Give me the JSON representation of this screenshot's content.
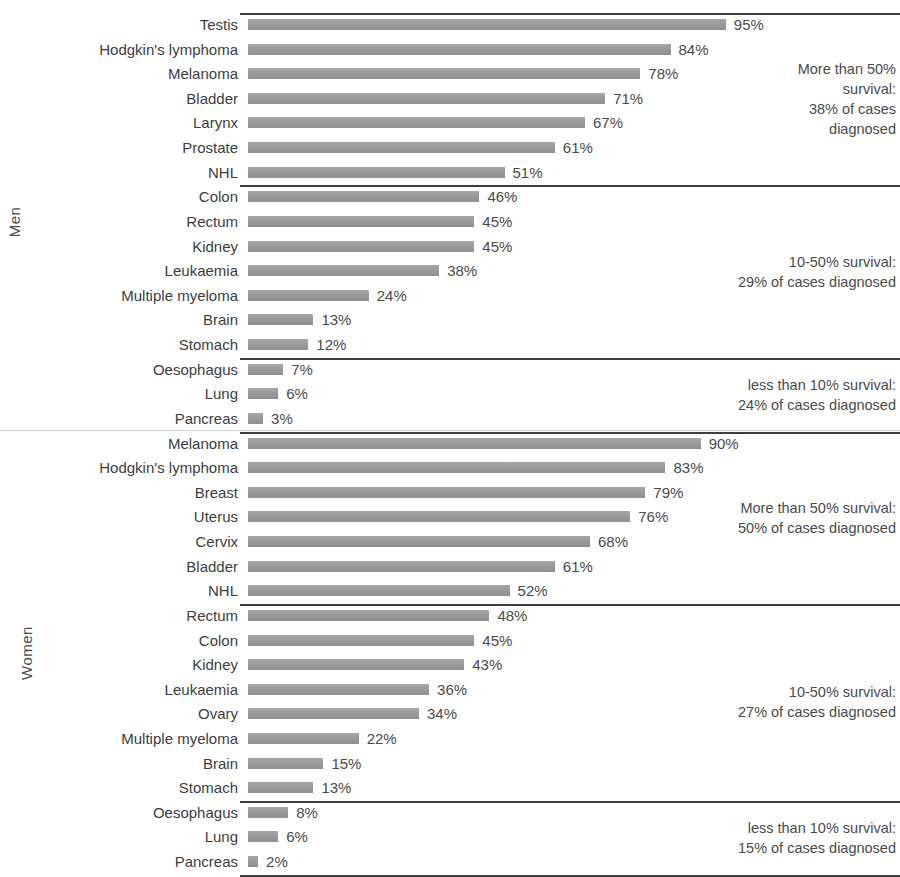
{
  "chart_data": {
    "type": "bar",
    "title": "",
    "subtitle": "",
    "xlabel": "",
    "ylabel": "",
    "orientation": "horizontal",
    "xlim": [
      0,
      100
    ],
    "grid": false,
    "legend": "none",
    "value_suffix": "%",
    "groups": [
      {
        "name": "Men",
        "label": "Men",
        "bands": [
          {
            "band": "More than 50% survival",
            "note": "More than 50%\nsurvival:\n38% of cases\ndiagnosed",
            "categories": [
              "Testis",
              "Hodgkin's lymphoma",
              "Melanoma",
              "Bladder",
              "Larynx",
              "Prostate",
              "NHL"
            ],
            "values": [
              95,
              84,
              78,
              71,
              67,
              61,
              51
            ],
            "labels": [
              "95%",
              "84%",
              "78%",
              "71%",
              "67%",
              "61%",
              "51%"
            ]
          },
          {
            "band": "10-50% survival",
            "note": "10-50% survival:\n29% of cases diagnosed",
            "categories": [
              "Colon",
              "Rectum",
              "Kidney",
              "Leukaemia",
              "Multiple myeloma",
              "Brain",
              "Stomach"
            ],
            "values": [
              46,
              45,
              45,
              38,
              24,
              13,
              12
            ],
            "labels": [
              "46%",
              "45%",
              "45%",
              "38%",
              "24%",
              "13%",
              "12%"
            ]
          },
          {
            "band": "less than 10% survival",
            "note": "less than 10% survival:\n24% of cases diagnosed",
            "categories": [
              "Oesophagus",
              "Lung",
              "Pancreas"
            ],
            "values": [
              7,
              6,
              3
            ],
            "labels": [
              "7%",
              "6%",
              "3%"
            ]
          }
        ]
      },
      {
        "name": "Women",
        "label": "Women",
        "bands": [
          {
            "band": "More than 50% survival",
            "note": "More than 50% survival:\n50% of cases diagnosed",
            "categories": [
              "Melanoma",
              "Hodgkin's lymphoma",
              "Breast",
              "Uterus",
              "Cervix",
              "Bladder",
              "NHL"
            ],
            "values": [
              90,
              83,
              79,
              76,
              68,
              61,
              52
            ],
            "labels": [
              "90%",
              "83%",
              "79%",
              "76%",
              "68%",
              "61%",
              "52%"
            ]
          },
          {
            "band": "10-50% survival",
            "note": "10-50% survival:\n27% of cases diagnosed",
            "categories": [
              "Rectum",
              "Colon",
              "Kidney",
              "Leukaemia",
              "Ovary",
              "Multiple myeloma",
              "Brain",
              "Stomach"
            ],
            "values": [
              48,
              45,
              43,
              36,
              34,
              22,
              15,
              13
            ],
            "labels": [
              "48%",
              "45%",
              "43%",
              "36%",
              "34%",
              "22%",
              "15%",
              "13%"
            ]
          },
          {
            "band": "less than 10% survival",
            "note": "less than 10% survival:\n15% of cases diagnosed",
            "categories": [
              "Oesophagus",
              "Lung",
              "Pancreas"
            ],
            "values": [
              8,
              6,
              2
            ],
            "labels": [
              "8%",
              "6%",
              "2%"
            ]
          }
        ]
      }
    ]
  },
  "annotations": {
    "men_high": "More than 50%\nsurvival:\n38% of cases\ndiagnosed",
    "men_mid": "10-50% survival:\n29% of cases diagnosed",
    "men_low": "less than 10% survival:\n24% of cases diagnosed",
    "women_high": "More than 50% survival:\n50% of cases diagnosed",
    "women_mid": "10-50% survival:\n27% of cases diagnosed",
    "women_low": "less than 10% survival:\n15% of cases diagnosed"
  },
  "axis_labels": {
    "men": "Men",
    "women": "Women"
  },
  "style": {
    "bar_color": "#9a9a9a",
    "text_color": "#4a4a4a",
    "rule_color": "#3f3f3f",
    "background": "#ffffff"
  }
}
